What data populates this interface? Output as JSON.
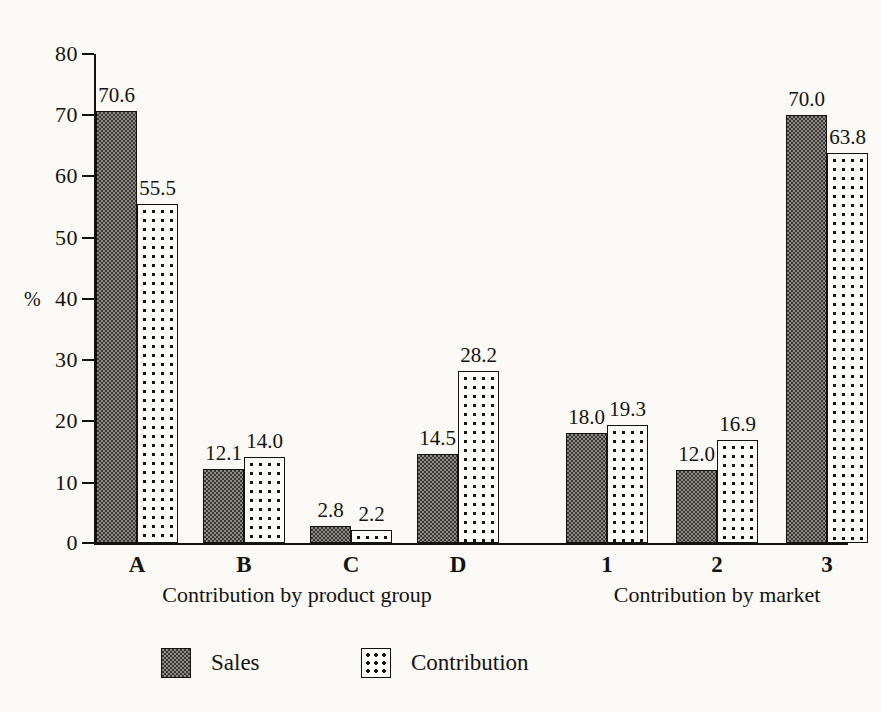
{
  "chart_data": {
    "type": "bar",
    "title": "",
    "xlabel": "",
    "ylabel": "%",
    "ylim": [
      0,
      80
    ],
    "ytick_values": [
      0,
      10,
      20,
      30,
      40,
      50,
      60,
      70,
      80
    ],
    "ytick_labels": [
      "0",
      "10",
      "20",
      "30",
      "40",
      "50",
      "60",
      "70",
      "80"
    ],
    "grid": false,
    "legend_position": "bottom",
    "categories": [
      "A",
      "B",
      "C",
      "D",
      "1",
      "2",
      "3"
    ],
    "series": [
      {
        "name": "Sales",
        "values": [
          70.6,
          12.1,
          2.8,
          14.5,
          18.0,
          12.0,
          70.0
        ],
        "labels": [
          "70.6",
          "12.1",
          "2.8",
          "14.5",
          "18.0",
          "12.0",
          "70.0"
        ],
        "pattern": "dark-checker"
      },
      {
        "name": "Contribution",
        "values": [
          55.5,
          14.0,
          2.2,
          28.2,
          19.3,
          16.9,
          63.8
        ],
        "labels": [
          "55.5",
          "14.0",
          "2.2",
          "28.2",
          "19.3",
          "16.9",
          "63.8"
        ],
        "pattern": "light-dots"
      }
    ],
    "groups": [
      {
        "caption": "Contribution by product group",
        "categories": [
          "A",
          "B",
          "C",
          "D"
        ]
      },
      {
        "caption": "Contribution by market",
        "categories": [
          "1",
          "2",
          "3"
        ]
      }
    ],
    "annotations": []
  },
  "axis": {
    "y_title": "%",
    "ticks": [
      "80",
      "70",
      "60",
      "50",
      "40",
      "30",
      "20",
      "10",
      "0"
    ]
  },
  "categories": [
    {
      "label": "A",
      "sales": "70.6",
      "contribution": "55.5"
    },
    {
      "label": "B",
      "sales": "12.1",
      "contribution": "14.0"
    },
    {
      "label": "C",
      "sales": "2.8",
      "contribution": "2.2"
    },
    {
      "label": "D",
      "sales": "14.5",
      "contribution": "28.2"
    },
    {
      "label": "1",
      "sales": "18.0",
      "contribution": "19.3"
    },
    {
      "label": "2",
      "sales": "12.0",
      "contribution": "16.9"
    },
    {
      "label": "3",
      "sales": "70.0",
      "contribution": "63.8"
    }
  ],
  "captions": {
    "left": "Contribution by product group",
    "right": "Contribution by market"
  },
  "legend": {
    "sales_label": "Sales",
    "contribution_label": "Contribution"
  },
  "colors": {
    "ink": "#141210",
    "page": "#fbfaf7",
    "sales_fill": "#8e8b86",
    "contribution_fill": "#fdfdfb"
  }
}
